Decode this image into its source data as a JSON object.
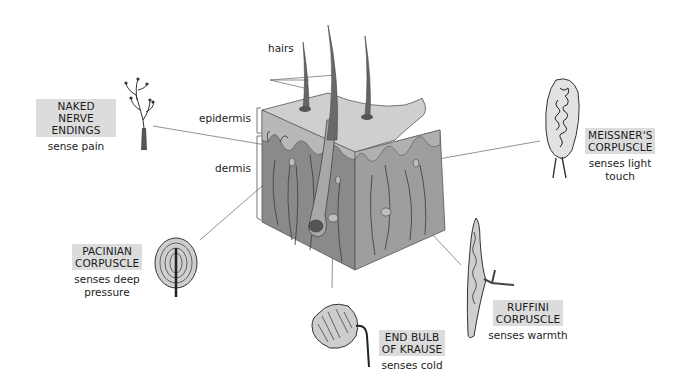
{
  "diagram": {
    "structure_labels": {
      "hairs": "hairs",
      "epidermis": "epidermis",
      "dermis": "dermis"
    },
    "receptors": [
      {
        "id": "naked-nerve-endings",
        "title_lines": [
          "NAKED NERVE",
          "ENDINGS"
        ],
        "desc_lines": [
          "sense pain"
        ]
      },
      {
        "id": "meissners-corpuscle",
        "title_lines": [
          "MEISSNER'S",
          "CORPUSCLE"
        ],
        "desc_lines": [
          "senses light",
          "touch"
        ]
      },
      {
        "id": "pacinian-corpuscle",
        "title_lines": [
          "PACINIAN",
          "CORPUSCLE"
        ],
        "desc_lines": [
          "senses deep",
          "pressure"
        ]
      },
      {
        "id": "end-bulb-of-krause",
        "title_lines": [
          "END BULB",
          "OF KRAUSE"
        ],
        "desc_lines": [
          "senses cold"
        ]
      },
      {
        "id": "ruffini-corpuscle",
        "title_lines": [
          "RUFFINI",
          "CORPUSCLE"
        ],
        "desc_lines": [
          "senses warmth"
        ]
      }
    ],
    "colors": {
      "label_bg": "#dcdcdc",
      "skin_top": "#c8c8c8",
      "skin_front": "#8a8a8a",
      "skin_side": "#9c9c9c",
      "leader_line": "#777777"
    }
  }
}
